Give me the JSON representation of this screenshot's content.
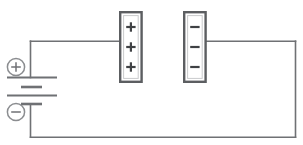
{
  "diagram": {
    "title": "Parallel plate capacitor connected to a battery",
    "background_color": "#ffffff",
    "wire_color": "#6f7174",
    "plate_border_color": "#5c5e61",
    "charge_color": "#3f4144",
    "terminal_color": "#8b8d90",
    "width": 303,
    "height": 145
  },
  "battery": {
    "name": "battery",
    "positive_terminal_label": "+",
    "negative_terminal_label": "−",
    "plate_count": 4,
    "plates": [
      {
        "type": "long",
        "label": "positive-long-plate"
      },
      {
        "type": "short",
        "label": "negative-short-plate"
      },
      {
        "type": "long",
        "label": "positive-long-plate"
      },
      {
        "type": "short",
        "label": "negative-short-plate"
      }
    ]
  },
  "plates": [
    {
      "name": "positive-plate",
      "polarity": "positive",
      "charge_symbol": "+",
      "charge_count": 3,
      "charges": [
        "+",
        "+",
        "+"
      ]
    },
    {
      "name": "negative-plate",
      "polarity": "negative",
      "charge_symbol": "−",
      "charge_count": 3,
      "charges": [
        "−",
        "−",
        "−"
      ]
    }
  ],
  "wires": [
    {
      "name": "top-left-wire",
      "from": "battery-positive-terminal",
      "to": "positive-plate"
    },
    {
      "name": "top-right-wire",
      "from": "negative-plate",
      "to": "right-riser"
    },
    {
      "name": "right-riser-wire",
      "from": "top-right-wire",
      "to": "bottom-wire"
    },
    {
      "name": "bottom-wire",
      "from": "right-riser",
      "to": "battery-negative-terminal"
    },
    {
      "name": "battery-lower-lead",
      "from": "battery-negative-plate",
      "to": "bottom-wire"
    }
  ]
}
